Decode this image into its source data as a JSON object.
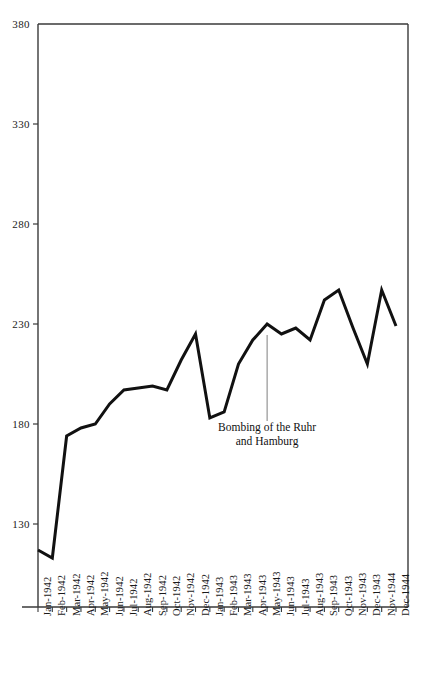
{
  "chart_data": {
    "type": "line",
    "title": "",
    "subtitle": "",
    "xlabel": "",
    "ylabel": "",
    "ylim": [
      108,
      380
    ],
    "xlim": [
      0,
      25
    ],
    "grid": false,
    "legend": false,
    "yticks": [
      130,
      180,
      230,
      280,
      330,
      380
    ],
    "ytick_labels": [
      "130",
      "180",
      "230",
      "280",
      "330",
      "380"
    ],
    "categories": [
      "Jan-1942",
      "Feb-1942",
      "Mar-1942",
      "Apr-1942",
      "May-1942",
      "Jun-1942",
      "Jul-1942",
      "Aug-1942",
      "Sep-1942",
      "Oct-1942",
      "Nov-1942",
      "Dec-1942",
      "Jan-1943",
      "Feb-1943",
      "Mar-1943",
      "Apr-1943",
      "May-1943",
      "Jun-1943",
      "Jul-1943",
      "Aug-1943",
      "Sep-1943",
      "Oct-1943",
      "Nov-1943",
      "Dec-1943",
      "Nov-1944",
      "Dec-1944"
    ],
    "values": [
      117,
      113,
      174,
      178,
      180,
      190,
      197,
      198,
      199,
      197,
      212,
      225,
      183,
      186,
      210,
      222,
      230,
      225,
      228,
      222,
      242,
      247,
      228,
      210,
      247,
      229
    ],
    "series": [
      {
        "name": "German armaments production index",
        "values": [
          117,
          113,
          174,
          178,
          180,
          190,
          197,
          198,
          199,
          197,
          212,
          225,
          183,
          186,
          210,
          222,
          230,
          225,
          228,
          222,
          242,
          247,
          228,
          210,
          247,
          229
        ]
      }
    ],
    "annotations": [
      {
        "text_line1": "Bombing of the Ruhr",
        "text_line2": "and Hamburg",
        "at_category": "May-1943",
        "marker": "vertical-line"
      }
    ],
    "line_color": "#111111",
    "axis_color": "#3a3a3a",
    "annotation_line_color": "#7a7a7a"
  },
  "annotation": {
    "line1": "Bombing of the Ruhr",
    "line2": "and Hamburg"
  }
}
